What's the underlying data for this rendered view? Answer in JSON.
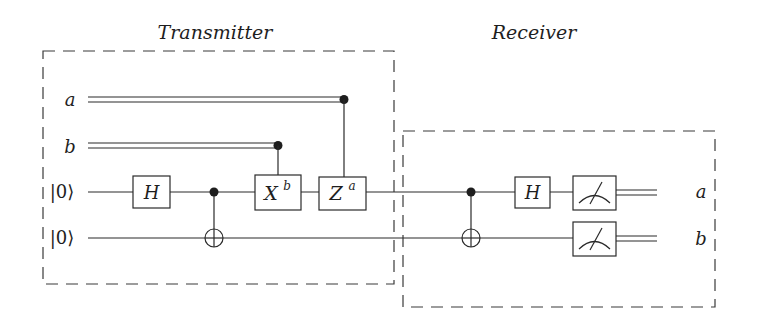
{
  "diagram": {
    "type": "quantum-circuit",
    "title_left": "Transmitter",
    "title_right": "Receiver",
    "inputs": {
      "classical_a": "a",
      "classical_b": "b",
      "qubit_1": "|0⟩",
      "qubit_2": "|0⟩"
    },
    "transmitter_gates": {
      "hadamard": "H",
      "cnot": "CNOT",
      "x_gate": "X",
      "x_exp": "b",
      "z_gate": "Z",
      "z_exp": "a"
    },
    "receiver_gates": {
      "cnot": "CNOT",
      "hadamard": "H",
      "measure_1": "measure",
      "measure_2": "measure"
    },
    "outputs": {
      "out_a": "a",
      "out_b": "b"
    },
    "colors": {
      "ink": "#2a2a2a",
      "background": "#ffffff"
    }
  }
}
